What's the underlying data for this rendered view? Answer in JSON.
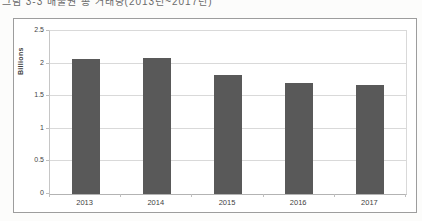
{
  "page": {
    "caption": "그림 3-3  배출권 총 거래량(2013년~2017년)"
  },
  "chart_data": {
    "type": "bar",
    "categories": [
      "2013",
      "2014",
      "2015",
      "2016",
      "2017"
    ],
    "values": [
      2.07,
      2.09,
      1.82,
      1.7,
      1.67
    ],
    "title": "",
    "xlabel": "",
    "ylabel": "Billions",
    "ylim": [
      0,
      2.5
    ],
    "ytick_interval": 0.5,
    "ytick_labels": [
      "0",
      "0.5",
      "1",
      "1.5",
      "2",
      "2.5"
    ],
    "grid": "horizontal",
    "legend_position": "none",
    "bar_color": "#595959",
    "gridline_color": "#d9d9d9",
    "frame_color": "#9d9d9d",
    "background_color": "#ffffff"
  }
}
